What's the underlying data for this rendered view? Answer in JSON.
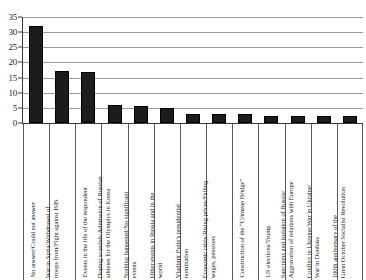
{
  "chart_data": {
    "type": "bar",
    "title": "",
    "subtitle": "",
    "xlabel": "",
    "ylabel": "",
    "ylim": [
      0,
      35
    ],
    "yticks": [
      0,
      5,
      10,
      15,
      20,
      25,
      30,
      35
    ],
    "grid": true,
    "legend": "none",
    "bar_color": "#1c1c1c",
    "orientation": "vertical",
    "categories": [
      "No answer/Could not answer",
      "War in Syria/Withdrawal of troops from/Fight against ISIS",
      "Events in the life of the respondent",
      "Doping scandals/Admission of Russian athletes for the Olympics in Korea",
      "Nothing happened/No significant events",
      "Other events in Russia and in the world",
      "Vladimir Putin's presidential nomination",
      "Economic crisis/Rising prices/Falling wages, pensions",
      "Construction of the “Crimean Bridge”",
      "US elections/Trump",
      "Sanctions and isolation of Russia/Aggravation of relations with Europe",
      "Conflict in Ukraine/War in Ukraine/War in Donbass",
      "100th anniversary of the Great October Socialist Revolution"
    ],
    "category_lines": [
      [
        "No answer/Could not answer"
      ],
      [
        "War in Syria/Withdrawal of",
        "troops from/Fight against ISIS"
      ],
      [
        "Events in the life of the respondent"
      ],
      [
        "Doping scandals/Admission of Russian",
        "athletes for the Olympics in Korea"
      ],
      [
        "Nothing happened/No significant",
        "events"
      ],
      [
        "Other events in Russia and in the",
        "world"
      ],
      [
        "Vladimir Putin's presidential",
        "nomination"
      ],
      [
        "Economic crisis/Rising prices/Falling",
        "wages, pensions"
      ],
      [
        "Construction of the “Crimean Bridge”"
      ],
      [
        "US elections/Trump"
      ],
      [
        "Sanctions and isolation of Russia/",
        "Aggravation of relations with Europe"
      ],
      [
        "Conflict in Ukraine/War in Ukraine/",
        "War in Donbass"
      ],
      [
        "100th anniversary of the",
        "Great October Socialist Revolution"
      ]
    ],
    "values": [
      32,
      17.3,
      17,
      6,
      5.6,
      4.8,
      3,
      3,
      2.9,
      2.3,
      2.3,
      2.3,
      2.2
    ]
  }
}
